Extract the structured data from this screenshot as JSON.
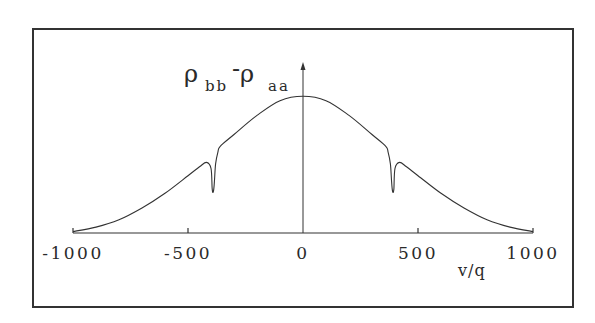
{
  "chart_data": {
    "type": "line",
    "title": "",
    "xlabel": "v/q",
    "ylabel": "ρ_bb - ρ_aa",
    "ylabel_parts": {
      "rho1": "ρ",
      "sub1": "bb",
      "minus": "-",
      "rho2": "ρ",
      "sub2": "aa"
    },
    "xlim": [
      -1000,
      1000
    ],
    "ylim": [
      0,
      1
    ],
    "x_ticks": [
      -1000,
      -500,
      0,
      500,
      1000
    ],
    "x_tick_labels": [
      "-1000",
      "-500",
      "0",
      "500",
      "1000"
    ],
    "y_ticks": [],
    "grid": false,
    "legend": null,
    "frame": true,
    "series": [
      {
        "name": "ρbb-ρaa",
        "color": "#333333",
        "x": [
          -1000,
          -900,
          -800,
          -700,
          -600,
          -500,
          -450,
          -420,
          -400,
          -395,
          -390,
          -385,
          -380,
          -370,
          -360,
          -300,
          -200,
          -100,
          0,
          100,
          200,
          300,
          360,
          370,
          380,
          385,
          390,
          395,
          400,
          420,
          450,
          500,
          600,
          700,
          800,
          900,
          1000
        ],
        "values": [
          0.01,
          0.04,
          0.09,
          0.17,
          0.27,
          0.39,
          0.45,
          0.48,
          0.44,
          0.3,
          0.28,
          0.35,
          0.47,
          0.55,
          0.59,
          0.67,
          0.8,
          0.9,
          0.93,
          0.9,
          0.8,
          0.67,
          0.59,
          0.55,
          0.47,
          0.35,
          0.28,
          0.3,
          0.44,
          0.48,
          0.45,
          0.39,
          0.27,
          0.17,
          0.09,
          0.04,
          0.01
        ]
      }
    ]
  }
}
